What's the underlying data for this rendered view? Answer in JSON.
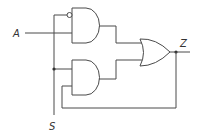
{
  "diagram": {
    "type": "logic-circuit",
    "labels": {
      "input_a": "A",
      "input_s": "S",
      "output_z": "Z"
    },
    "gates": [
      {
        "id": "and1",
        "kind": "AND",
        "inputs": [
          "NOT S",
          "A"
        ]
      },
      {
        "id": "and2",
        "kind": "AND",
        "inputs": [
          "S",
          "Z"
        ]
      },
      {
        "id": "or1",
        "kind": "OR",
        "inputs": [
          "and1",
          "and2"
        ],
        "output": "Z"
      }
    ],
    "colors": {
      "stroke": "#4a4a4a",
      "background": "#ffffff"
    }
  }
}
